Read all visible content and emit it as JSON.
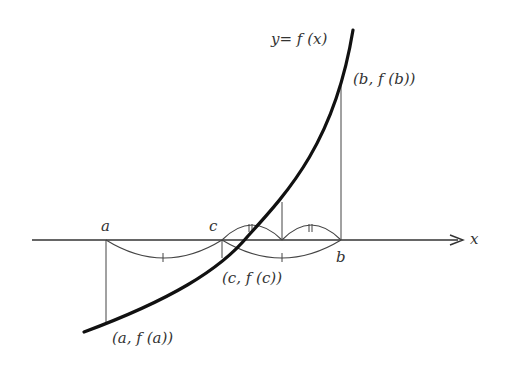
{
  "diagram": {
    "curve_label": "y= f (x)",
    "axis_label": "x",
    "point_a_label": "a",
    "point_b_label": "b",
    "point_c_label": "c",
    "point_fa_label": "(a, f (a))",
    "point_fb_label": "(b, f (b))",
    "point_fc_label": "(c, f (c))",
    "colors": {
      "stroke": "#111111",
      "text": "#333333",
      "background": "#ffffff"
    }
  }
}
